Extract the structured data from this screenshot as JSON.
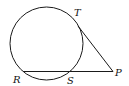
{
  "diagram": {
    "type": "circle-tangent-secant",
    "colors": {
      "stroke": "#1a1a1a",
      "background": "#ffffff",
      "text": "#111111"
    },
    "circle": {
      "cx": 46.5,
      "cy": 43.5,
      "r": 36.5
    },
    "points": {
      "T": {
        "label": "T",
        "x": 77,
        "y": 17
      },
      "P": {
        "label": "P",
        "x": 113,
        "y": 71
      },
      "R": {
        "label": "R",
        "x": 23,
        "y": 71
      },
      "S": {
        "label": "S",
        "x": 69,
        "y": 71
      }
    },
    "segments": [
      {
        "name": "tangent-PT",
        "from": "P",
        "to": "T"
      },
      {
        "name": "secant-PR",
        "from": "P",
        "to": "R"
      }
    ],
    "labels": {
      "T": "T",
      "P": "P",
      "R": "R",
      "S": "S"
    }
  }
}
